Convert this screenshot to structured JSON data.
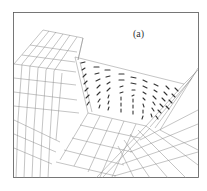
{
  "figure": {
    "panel_label": "(a)",
    "colors": {
      "background": "#ffffff",
      "frame": "#555555",
      "mesh": "#8a8a8a",
      "vectors": "#333333"
    },
    "frame": {
      "x": 13,
      "y": 12,
      "width": 186,
      "height": 166
    },
    "vector_field": {
      "columns": 9,
      "rows": 7
    }
  }
}
